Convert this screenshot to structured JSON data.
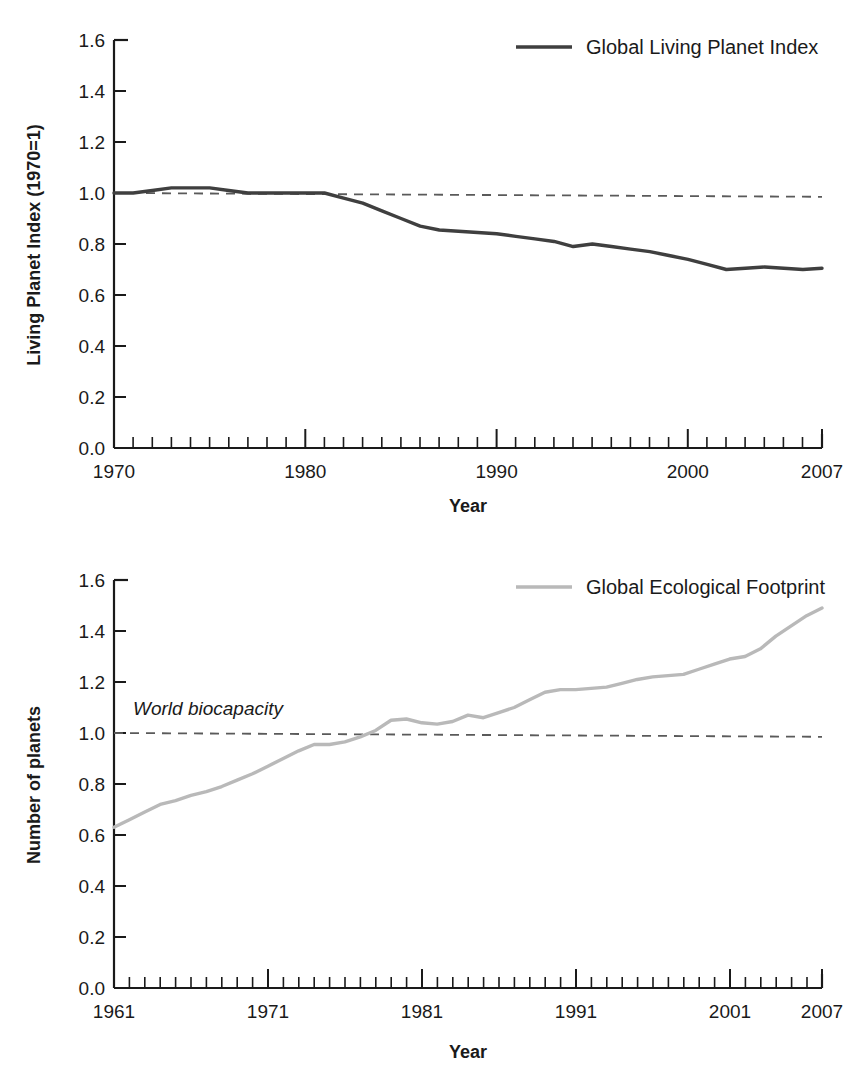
{
  "chart_data": [
    {
      "id": "global-living-planet-index",
      "type": "line",
      "title": "",
      "xlabel": "Year",
      "ylabel": "Living Planet Index (1970=1)",
      "xlim": [
        1970,
        2007
      ],
      "ylim": [
        0.0,
        1.6
      ],
      "grid": false,
      "legend_position": "top-right",
      "x_ticks": [
        1970,
        1980,
        1990,
        2000,
        2007
      ],
      "x_tick_labels": [
        "1970",
        "1980",
        "1990",
        "2000",
        "2007"
      ],
      "y_ticks": [
        0.0,
        0.2,
        0.4,
        0.6,
        0.8,
        1.0,
        1.2,
        1.4,
        1.6
      ],
      "y_tick_labels": [
        "0.0",
        "0.2",
        "0.4",
        "0.6",
        "0.8",
        "1.0",
        "1.2",
        "1.4",
        "1.6"
      ],
      "minor_x_tick_interval": 1,
      "series": [
        {
          "name": "Global Living Planet Index",
          "color": "#3f3f3f",
          "linewidth": 3,
          "style": "solid",
          "x": [
            1970,
            1971,
            1972,
            1973,
            1974,
            1975,
            1976,
            1977,
            1978,
            1979,
            1980,
            1981,
            1982,
            1983,
            1984,
            1985,
            1986,
            1987,
            1988,
            1989,
            1990,
            1991,
            1992,
            1993,
            1994,
            1995,
            1996,
            1997,
            1998,
            1999,
            2000,
            2001,
            2002,
            2003,
            2004,
            2005,
            2006,
            2007
          ],
          "values": [
            1.0,
            1.0,
            1.01,
            1.02,
            1.02,
            1.02,
            1.01,
            1.0,
            1.0,
            1.0,
            1.0,
            1.0,
            0.98,
            0.96,
            0.93,
            0.9,
            0.87,
            0.855,
            0.85,
            0.845,
            0.84,
            0.83,
            0.82,
            0.81,
            0.79,
            0.8,
            0.79,
            0.78,
            0.77,
            0.755,
            0.74,
            0.72,
            0.7,
            0.705,
            0.71,
            0.705,
            0.7,
            0.705
          ]
        }
      ],
      "reference_lines": [
        {
          "name": "baseline-1970",
          "style": "dashed",
          "color": "#5a5a5a",
          "y_start": 1.0,
          "y_end": 0.985,
          "label": ""
        }
      ]
    },
    {
      "id": "global-ecological-footprint",
      "type": "line",
      "title": "",
      "xlabel": "Year",
      "ylabel": "Number of planets",
      "xlim": [
        1961,
        2007
      ],
      "ylim": [
        0.0,
        1.6
      ],
      "grid": false,
      "legend_position": "top-right",
      "x_ticks": [
        1961,
        1971,
        1981,
        1991,
        2001,
        2007
      ],
      "x_tick_labels": [
        "1961",
        "1971",
        "1981",
        "1991",
        "2001",
        "2007"
      ],
      "y_ticks": [
        0.0,
        0.2,
        0.4,
        0.6,
        0.8,
        1.0,
        1.2,
        1.4,
        1.6
      ],
      "y_tick_labels": [
        "0.0",
        "0.2",
        "0.4",
        "0.6",
        "0.8",
        "1.0",
        "1.2",
        "1.4",
        "1.6"
      ],
      "minor_x_tick_interval": 1,
      "series": [
        {
          "name": "Global Ecological Footprint",
          "color": "#b9b9b9",
          "linewidth": 3,
          "style": "solid",
          "x": [
            1961,
            1962,
            1963,
            1964,
            1965,
            1966,
            1967,
            1968,
            1969,
            1970,
            1971,
            1972,
            1973,
            1974,
            1975,
            1976,
            1977,
            1978,
            1979,
            1980,
            1981,
            1982,
            1983,
            1984,
            1985,
            1986,
            1987,
            1988,
            1989,
            1990,
            1991,
            1992,
            1993,
            1994,
            1995,
            1996,
            1997,
            1998,
            1999,
            2000,
            2001,
            2002,
            2003,
            2004,
            2005,
            2006,
            2007
          ],
          "values": [
            0.63,
            0.66,
            0.69,
            0.72,
            0.735,
            0.755,
            0.77,
            0.79,
            0.815,
            0.84,
            0.87,
            0.9,
            0.93,
            0.955,
            0.955,
            0.965,
            0.985,
            1.01,
            1.05,
            1.055,
            1.04,
            1.035,
            1.045,
            1.07,
            1.06,
            1.08,
            1.1,
            1.13,
            1.16,
            1.17,
            1.17,
            1.175,
            1.18,
            1.195,
            1.21,
            1.22,
            1.225,
            1.23,
            1.25,
            1.27,
            1.29,
            1.3,
            1.33,
            1.38,
            1.42,
            1.46,
            1.49
          ]
        }
      ],
      "reference_lines": [
        {
          "name": "world-biocapacity",
          "style": "dashed",
          "color": "#5a5a5a",
          "y_start": 1.0,
          "y_end": 0.985,
          "label": "World biocapacity"
        }
      ]
    }
  ],
  "charts": {
    "top": {
      "legend_label": "Global Living Planet Index",
      "y_axis_title": "Living Planet Index (1970=1)",
      "x_axis_title": "Year",
      "y_labels": [
        "1.6",
        "1.4",
        "1.2",
        "1.0",
        "0.8",
        "0.6",
        "0.4",
        "0.2",
        "0.0"
      ],
      "x_labels": [
        "1970",
        "1980",
        "1990",
        "2000",
        "2007"
      ]
    },
    "bottom": {
      "legend_label": "Global Ecological Footprint",
      "y_axis_title": "Number of planets",
      "x_axis_title": "Year",
      "annotation": "World biocapacity",
      "y_labels": [
        "1.6",
        "1.4",
        "1.2",
        "1.0",
        "0.8",
        "0.6",
        "0.4",
        "0.2",
        "0.0"
      ],
      "x_labels": [
        "1961",
        "1971",
        "1981",
        "1991",
        "2001",
        "2007"
      ]
    }
  },
  "colors": {
    "line_top": "#3f3f3f",
    "line_bottom": "#b9b9b9",
    "axis": "#1a1a1a",
    "reference": "#5a5a5a",
    "background": "#ffffff"
  }
}
